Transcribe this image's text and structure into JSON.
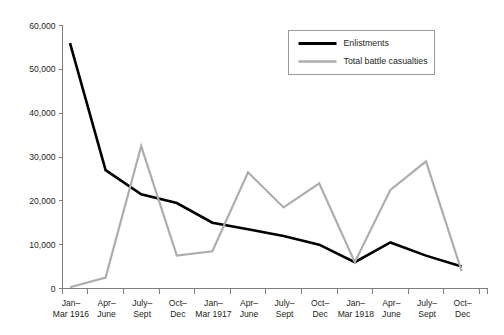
{
  "chart_data": {
    "type": "line",
    "title": "",
    "xlabel": "",
    "ylabel": "",
    "ylim": [
      0,
      60000
    ],
    "grid": false,
    "legend_position": "top-right",
    "categories": [
      "Jan–\nMar 1916",
      "Apr–\nJune",
      "July–\nSept",
      "Oct–\nDec",
      "Jan–\nMar 1917",
      "Apr–\nJune",
      "July–\nSept",
      "Oct–\nDec",
      "Jan–\nMar 1918",
      "Apr–\nJune",
      "July–\nSept",
      "Oct–\nDec"
    ],
    "category_lines": [
      [
        "Jan–",
        "Mar 1916"
      ],
      [
        "Apr–",
        "June"
      ],
      [
        "July–",
        "Sept"
      ],
      [
        "Oct–",
        "Dec"
      ],
      [
        "Jan–",
        "Mar 1917"
      ],
      [
        "Apr–",
        "June"
      ],
      [
        "July–",
        "Sept"
      ],
      [
        "Oct–",
        "Dec"
      ],
      [
        "Jan–",
        "Mar 1918"
      ],
      [
        "Apr–",
        "June"
      ],
      [
        "July–",
        "Sept"
      ],
      [
        "Oct–",
        "Dec"
      ]
    ],
    "ytick_values": [
      0,
      10000,
      20000,
      30000,
      40000,
      50000,
      60000
    ],
    "ytick_labels": [
      "0",
      "10,000",
      "20,000",
      "30,000",
      "40,000",
      "50,000",
      "60,000"
    ],
    "series": [
      {
        "name": "Enlistments",
        "color": "#000000",
        "width": 2.6,
        "values": [
          56000,
          27000,
          21500,
          19500,
          15000,
          13500,
          12000,
          10000,
          6000,
          10500,
          7500,
          5000
        ]
      },
      {
        "name": "Total battle casualties",
        "color": "#adadad",
        "width": 2.2,
        "values": [
          300,
          2500,
          32500,
          7500,
          8500,
          26500,
          18500,
          24000,
          6000,
          22500,
          29000,
          4000
        ]
      }
    ]
  },
  "legend": {
    "items": [
      {
        "label": "Enlistments",
        "color": "#000000"
      },
      {
        "label": "Total battle casualties",
        "color": "#adadad"
      }
    ]
  }
}
